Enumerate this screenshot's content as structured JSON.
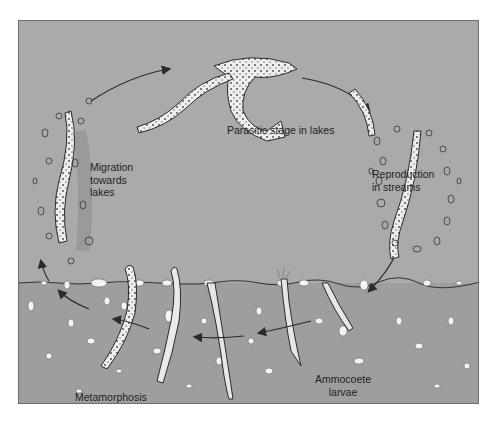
{
  "diagram": {
    "colors": {
      "water": "#aaaaaa",
      "sediment": "#9e9e9e",
      "frame_border": "#6e6e6e",
      "line": "#2a2a2a",
      "highlight": "#f2f2f2"
    },
    "stages": [
      {
        "id": "parasitic",
        "label": "Parasitic stage in lakes"
      },
      {
        "id": "reproduction",
        "label_lines": [
          "Reproduction",
          "in streams"
        ]
      },
      {
        "id": "larvae",
        "label_lines": [
          "Ammocoete",
          "larvae"
        ]
      },
      {
        "id": "metamorphosis",
        "label": "Metamorphosis"
      },
      {
        "id": "migration",
        "label_lines": [
          "Migration",
          "towards",
          "lakes"
        ]
      }
    ],
    "cycle_direction": "clockwise"
  }
}
